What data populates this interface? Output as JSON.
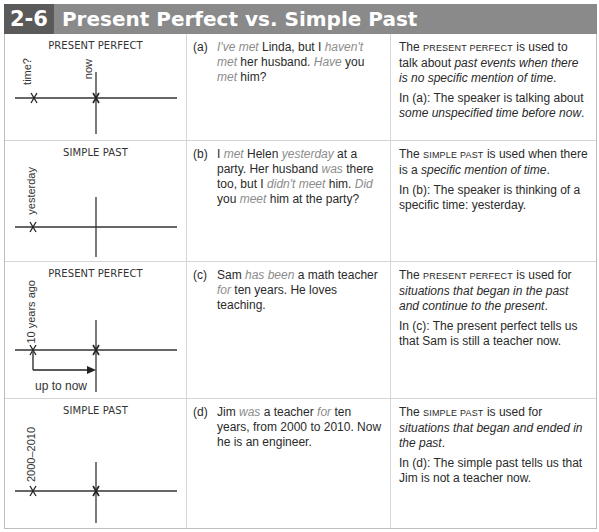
{
  "header": {
    "number": "2-6",
    "title": "Present Perfect vs. Simple Past"
  },
  "rows": [
    {
      "diagram": {
        "title": "PRESENT PERFECT",
        "labels": [
          "time?",
          "now"
        ],
        "extra": ""
      },
      "example": {
        "label": "(a)",
        "parts": [
          {
            "t": "I've met",
            "hl": true
          },
          {
            "t": " Linda, but I ",
            "hl": false
          },
          {
            "t": "haven't met",
            "hl": true
          },
          {
            "t": " her husband.  ",
            "hl": false
          },
          {
            "t": "Have",
            "hl": true
          },
          {
            "t": " you ",
            "hl": false
          },
          {
            "t": "met",
            "hl": true
          },
          {
            "t": " him?",
            "hl": false
          }
        ]
      },
      "explanation": {
        "p1": [
          {
            "t": "The ",
            "s": "n"
          },
          {
            "t": "present perfect",
            "s": "sc"
          },
          {
            "t": " is used to talk about ",
            "s": "n"
          },
          {
            "t": "past events when there is no specific mention of time",
            "s": "it"
          },
          {
            "t": ".",
            "s": "n"
          }
        ],
        "p2": [
          {
            "t": "In (a):  The speaker is talking about ",
            "s": "n"
          },
          {
            "t": "some unspecified time before now",
            "s": "it"
          },
          {
            "t": ".",
            "s": "n"
          }
        ]
      }
    },
    {
      "diagram": {
        "title": "SIMPLE PAST",
        "labels": [
          "yesterday"
        ],
        "extra": ""
      },
      "example": {
        "label": "(b)",
        "parts": [
          {
            "t": "I ",
            "hl": false
          },
          {
            "t": "met",
            "hl": true
          },
          {
            "t": " Helen ",
            "hl": false
          },
          {
            "t": "yesterday",
            "hl": true
          },
          {
            "t": " at a party. Her husband ",
            "hl": false
          },
          {
            "t": "was",
            "hl": true
          },
          {
            "t": " there too, but I ",
            "hl": false
          },
          {
            "t": "didn't meet",
            "hl": true
          },
          {
            "t": " him.  ",
            "hl": false
          },
          {
            "t": "Did",
            "hl": true
          },
          {
            "t": " you ",
            "hl": false
          },
          {
            "t": "meet",
            "hl": true
          },
          {
            "t": " him at the party?",
            "hl": false
          }
        ]
      },
      "explanation": {
        "p1": [
          {
            "t": "The ",
            "s": "n"
          },
          {
            "t": "simple past",
            "s": "sc"
          },
          {
            "t": " is used when there is a ",
            "s": "n"
          },
          {
            "t": "specific mention of time",
            "s": "it"
          },
          {
            "t": ".",
            "s": "n"
          }
        ],
        "p2": [
          {
            "t": "In (b):  The speaker is thinking of a specific time:  yesterday.",
            "s": "n"
          }
        ]
      }
    },
    {
      "diagram": {
        "title": "PRESENT PERFECT",
        "labels": [
          "10 years ago"
        ],
        "extra": "up to now"
      },
      "example": {
        "label": "(c)",
        "parts": [
          {
            "t": "Sam ",
            "hl": false
          },
          {
            "t": "has been",
            "hl": true
          },
          {
            "t": " a math teacher ",
            "hl": false
          },
          {
            "t": "for",
            "hl": true
          },
          {
            "t": " ten years.  He loves teaching.",
            "hl": false
          }
        ]
      },
      "explanation": {
        "p1": [
          {
            "t": "The ",
            "s": "n"
          },
          {
            "t": "present perfect",
            "s": "sc"
          },
          {
            "t": " is used for ",
            "s": "n"
          },
          {
            "t": "situations that began in the past and continue to the present",
            "s": "it"
          },
          {
            "t": ".",
            "s": "n"
          }
        ],
        "p2": [
          {
            "t": "In (c):  The present perfect tells us that Sam is still a teacher now.",
            "s": "n"
          }
        ]
      }
    },
    {
      "diagram": {
        "title": "SIMPLE PAST",
        "labels": [
          "2000–2010"
        ],
        "extra": ""
      },
      "example": {
        "label": "(d)",
        "parts": [
          {
            "t": "Jim ",
            "hl": false
          },
          {
            "t": "was",
            "hl": true
          },
          {
            "t": " a teacher ",
            "hl": false
          },
          {
            "t": "for",
            "hl": true
          },
          {
            "t": " ten years, from 2000 to 2010.  Now he is an engineer.",
            "hl": false
          }
        ]
      },
      "explanation": {
        "p1": [
          {
            "t": "The ",
            "s": "n"
          },
          {
            "t": "simple past",
            "s": "sc"
          },
          {
            "t": " is used for ",
            "s": "n"
          },
          {
            "t": "situations that began and ended in the past",
            "s": "it"
          },
          {
            "t": ".",
            "s": "n"
          }
        ],
        "p2": [
          {
            "t": "In (d):  The simple past tells us that Jim is not a teacher now.",
            "s": "n"
          }
        ]
      }
    }
  ],
  "colors": {
    "header_bg": "#8a8a8a",
    "header_num_bg": "#5a5a5a",
    "highlight_text": "#8c8c8c",
    "border": "#d6d6d6"
  }
}
